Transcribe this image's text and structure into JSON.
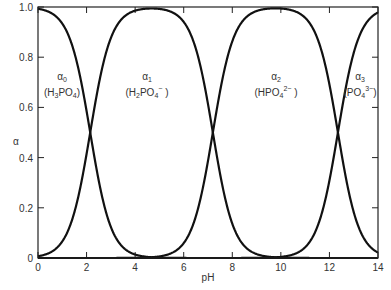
{
  "chart_data": {
    "type": "line",
    "title": "",
    "xlabel": "pH",
    "ylabel": "α",
    "xlim": [
      0,
      14
    ],
    "ylim": [
      0,
      1.0
    ],
    "x_ticks": [
      "0",
      "2",
      "4",
      "6",
      "8",
      "10",
      "12",
      "14"
    ],
    "y_ticks": [
      "0",
      "0.2",
      "0.4",
      "0.6",
      "0.8",
      "1.0"
    ],
    "grid": false,
    "pKa": [
      2.15,
      7.2,
      12.35
    ],
    "series": [
      {
        "name": "α0",
        "species": "H3PO4",
        "x": [
          0,
          1,
          2,
          2.15,
          3,
          4,
          5
        ],
        "values": [
          0.99,
          0.93,
          0.59,
          0.5,
          0.12,
          0.01,
          0.0
        ]
      },
      {
        "name": "α1",
        "species": "H2PO4−",
        "x": [
          0,
          1,
          2,
          2.15,
          3,
          4,
          4.7,
          6,
          7,
          7.2,
          8,
          9,
          10
        ],
        "values": [
          0.01,
          0.07,
          0.41,
          0.5,
          0.88,
          0.99,
          0.99,
          0.94,
          0.61,
          0.5,
          0.14,
          0.02,
          0.0
        ]
      },
      {
        "name": "α2",
        "species": "HPO42−",
        "x": [
          5,
          6,
          7,
          7.2,
          8,
          9,
          9.8,
          11,
          12,
          12.35,
          13,
          14
        ],
        "values": [
          0.01,
          0.06,
          0.39,
          0.5,
          0.86,
          0.98,
          0.99,
          0.96,
          0.69,
          0.5,
          0.18,
          0.02
        ]
      },
      {
        "name": "α3",
        "species": "PO43−",
        "x": [
          10,
          11,
          12,
          12.35,
          13,
          14
        ],
        "values": [
          0.0,
          0.04,
          0.31,
          0.5,
          0.82,
          0.98
        ]
      }
    ],
    "annotations": [
      {
        "label": "α0",
        "formula": "H3PO4",
        "x": 0.9,
        "y": 0.67
      },
      {
        "label": "α1",
        "formula": "H2PO4−",
        "x": 4.6,
        "y": 0.67
      },
      {
        "label": "α2",
        "formula": "HPO42−",
        "x": 9.8,
        "y": 0.67
      },
      {
        "label": "α3",
        "formula": "PO43−",
        "x": 13.4,
        "y": 0.67
      }
    ]
  },
  "labels": {
    "xlabel": "pH",
    "ylabel": "α",
    "alpha0": "α",
    "alpha0_sub": "0",
    "alpha1": "α",
    "alpha1_sub": "1",
    "alpha2": "α",
    "alpha2_sub": "2",
    "alpha3": "α",
    "alpha3_sub": "3"
  }
}
